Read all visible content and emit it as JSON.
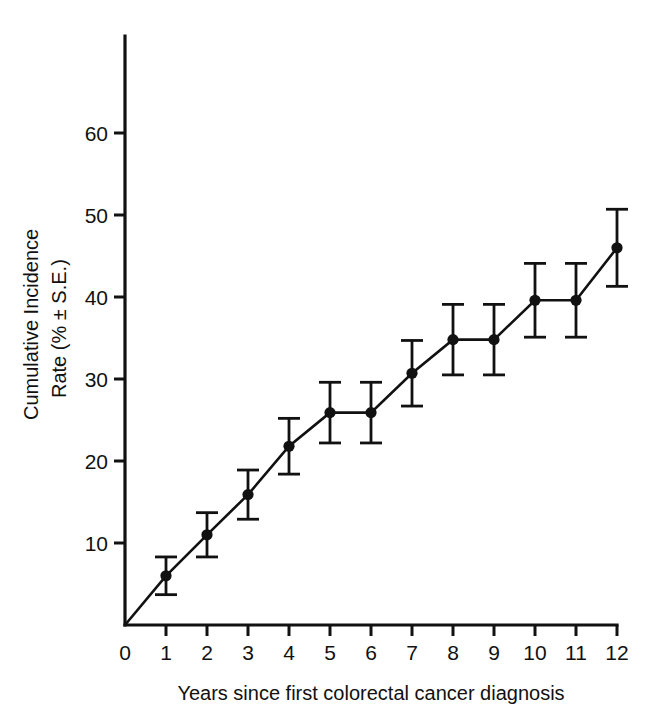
{
  "chart_data": {
    "type": "line",
    "title": "",
    "subtitle": "",
    "xlabel": "Years since first colorectal cancer diagnosis",
    "ylabel": "Cumulative Incidence\nRate (% ± S.E.)",
    "ylabel_line1": "Cumulative Incidence",
    "ylabel_line2": "Rate (% ± S.E.)",
    "grid": false,
    "legend": false,
    "legend_position": "none",
    "xlim": [
      0,
      12
    ],
    "ylim": [
      0,
      68
    ],
    "x_ticks": [
      0,
      1,
      2,
      3,
      4,
      5,
      6,
      7,
      8,
      9,
      10,
      11,
      12
    ],
    "x_tick_labels": [
      "0",
      "1",
      "2",
      "3",
      "4",
      "5",
      "6",
      "7",
      "8",
      "9",
      "10",
      "11",
      "12"
    ],
    "y_ticks": [
      10,
      20,
      30,
      40,
      50,
      60
    ],
    "y_tick_labels": [
      "10",
      "20",
      "30",
      "40",
      "50",
      "60"
    ],
    "x": [
      0,
      1,
      2,
      3,
      4,
      5,
      6,
      7,
      8,
      9,
      10,
      11,
      12
    ],
    "values": [
      0,
      6.0,
      11.0,
      15.9,
      21.8,
      25.9,
      25.9,
      30.7,
      34.8,
      34.8,
      39.6,
      39.6,
      46.0
    ],
    "errors": [
      0,
      2.3,
      2.7,
      3.0,
      3.4,
      3.7,
      3.7,
      4.0,
      4.3,
      4.3,
      4.5,
      4.5,
      4.7
    ],
    "series": [
      {
        "name": "Cumulative incidence rate",
        "marker": "filled-circle",
        "color": "#111111",
        "points": [
          {
            "x": 0,
            "y": 0,
            "se": 0,
            "show_marker": false,
            "show_error": false
          },
          {
            "x": 1,
            "y": 6.0,
            "se": 2.3,
            "show_marker": true,
            "show_error": true
          },
          {
            "x": 2,
            "y": 11.0,
            "se": 2.7,
            "show_marker": true,
            "show_error": true
          },
          {
            "x": 3,
            "y": 15.9,
            "se": 3.0,
            "show_marker": true,
            "show_error": true
          },
          {
            "x": 4,
            "y": 21.8,
            "se": 3.4,
            "show_marker": true,
            "show_error": true
          },
          {
            "x": 5,
            "y": 25.9,
            "se": 3.7,
            "show_marker": true,
            "show_error": true
          },
          {
            "x": 6,
            "y": 25.9,
            "se": 3.7,
            "show_marker": true,
            "show_error": true
          },
          {
            "x": 7,
            "y": 30.7,
            "se": 4.0,
            "show_marker": true,
            "show_error": true
          },
          {
            "x": 8,
            "y": 34.8,
            "se": 4.3,
            "show_marker": true,
            "show_error": true
          },
          {
            "x": 9,
            "y": 34.8,
            "se": 4.3,
            "show_marker": true,
            "show_error": true
          },
          {
            "x": 10,
            "y": 39.6,
            "se": 4.5,
            "show_marker": true,
            "show_error": true
          },
          {
            "x": 11,
            "y": 39.6,
            "se": 4.5,
            "show_marker": true,
            "show_error": true
          },
          {
            "x": 12,
            "y": 46.0,
            "se": 4.7,
            "show_marker": true,
            "show_error": true
          }
        ]
      }
    ],
    "colors": {
      "line": "#111111",
      "marker": "#111111",
      "axis": "#111111",
      "background": "#ffffff"
    }
  }
}
